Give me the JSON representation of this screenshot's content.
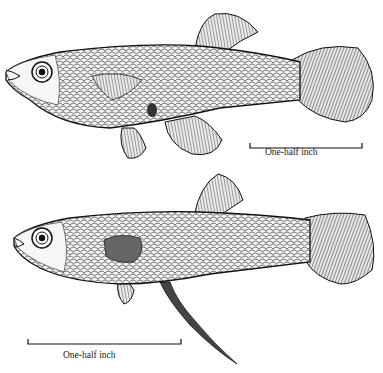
{
  "figure": {
    "background": "#ffffff",
    "ink": "#1a1a1a",
    "fish": [
      {
        "id": "female",
        "position": "top",
        "scale_bar": {
          "label": "One-half inch",
          "x1": 250,
          "x2": 362,
          "y": 148
        }
      },
      {
        "id": "male",
        "position": "bottom",
        "scale_bar": {
          "label": "One-half inch",
          "x1": 28,
          "x2": 181,
          "y": 344
        }
      }
    ]
  }
}
